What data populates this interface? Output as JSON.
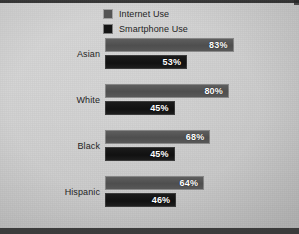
{
  "chart_data": {
    "type": "bar",
    "orientation": "horizontal",
    "title": "",
    "subtitle": "",
    "xlabel": "",
    "ylabel": "",
    "xlim": [
      0,
      100
    ],
    "grid": false,
    "legend_position": "top-left",
    "value_suffix": "%",
    "categories": [
      "Asian",
      "White",
      "Black",
      "Hispanic"
    ],
    "series": [
      {
        "name": "Internet Use",
        "color": "#545454",
        "values": [
          83,
          80,
          68,
          64
        ],
        "labels": [
          "83%",
          "80%",
          "68%",
          "64%"
        ]
      },
      {
        "name": "Smartphone Use",
        "color": "#141414",
        "values": [
          53,
          45,
          45,
          46
        ],
        "labels": [
          "53%",
          "45%",
          "45%",
          "46%"
        ]
      }
    ]
  },
  "legend": {
    "items": [
      {
        "label": "Internet Use",
        "swatch": "#545454",
        "icon": "legend-swatch-icon"
      },
      {
        "label": "Smartphone Use",
        "swatch": "#141414",
        "icon": "legend-swatch-icon"
      }
    ]
  },
  "groups": [
    {
      "label": "Asian",
      "internet": {
        "value": 83,
        "label": "83%"
      },
      "smartphone": {
        "value": 53,
        "label": "53%"
      }
    },
    {
      "label": "White",
      "internet": {
        "value": 80,
        "label": "80%"
      },
      "smartphone": {
        "value": 45,
        "label": "45%"
      }
    },
    {
      "label": "Black",
      "internet": {
        "value": 68,
        "label": "68%"
      },
      "smartphone": {
        "value": 45,
        "label": "45%"
      }
    },
    {
      "label": "Hispanic",
      "internet": {
        "value": 64,
        "label": "64%"
      },
      "smartphone": {
        "value": 46,
        "label": "46%"
      }
    }
  ],
  "colors": {
    "background": "#d2d2d2",
    "internet_bar": "#545454",
    "smartphone_bar": "#141414",
    "value_text": "#ffffff",
    "label_text": "#1f1f1f"
  }
}
